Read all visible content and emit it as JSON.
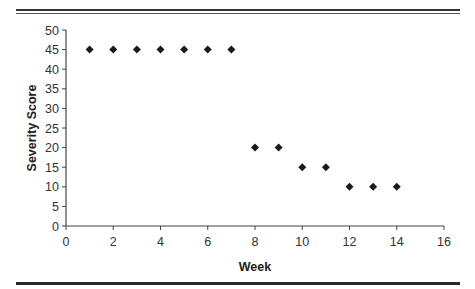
{
  "chart_data": {
    "type": "scatter",
    "title": "",
    "xlabel": "Week",
    "ylabel": "Severity Score",
    "xlim": [
      0,
      16
    ],
    "ylim": [
      0,
      50
    ],
    "xticks": [
      0,
      2,
      4,
      6,
      8,
      10,
      12,
      14,
      16
    ],
    "yticks": [
      0,
      5,
      10,
      15,
      20,
      25,
      30,
      35,
      40,
      45,
      50
    ],
    "grid": false,
    "legend": null,
    "marker": "diamond",
    "marker_color": "#1a1a1a",
    "series": [
      {
        "name": "Severity Score",
        "points": [
          {
            "x": 1,
            "y": 45
          },
          {
            "x": 2,
            "y": 45
          },
          {
            "x": 3,
            "y": 45
          },
          {
            "x": 4,
            "y": 45
          },
          {
            "x": 5,
            "y": 45
          },
          {
            "x": 6,
            "y": 45
          },
          {
            "x": 7,
            "y": 45
          },
          {
            "x": 8,
            "y": 20
          },
          {
            "x": 9,
            "y": 20
          },
          {
            "x": 10,
            "y": 15
          },
          {
            "x": 11,
            "y": 15
          },
          {
            "x": 12,
            "y": 10
          },
          {
            "x": 13,
            "y": 10
          },
          {
            "x": 14,
            "y": 10
          }
        ]
      }
    ]
  },
  "labels": {
    "x_axis_title": "Week",
    "y_axis_title": "Severity Score"
  }
}
